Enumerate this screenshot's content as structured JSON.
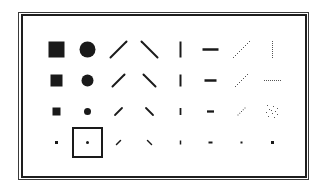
{
  "window": {
    "title": "Brush Shapes"
  },
  "colors": {
    "ink": "#1a1a1a",
    "dotted_ink": "#555555",
    "background": "#ffffff",
    "frame": "#1e1e1e"
  },
  "palette": {
    "columns": [
      "square",
      "circle",
      "forward-slash",
      "back-slash",
      "vertical-line",
      "horizontal-line",
      "dotted-forward-slash",
      "dotted-line"
    ],
    "rows": [
      {
        "size": "large"
      },
      {
        "size": "medium"
      },
      {
        "size": "small"
      },
      {
        "size": "tiny"
      }
    ],
    "selected": {
      "row": 3,
      "col": 1,
      "shape": "circle",
      "size": "tiny"
    },
    "brushes": [
      [
        {
          "shape": "square",
          "size": 16
        },
        {
          "shape": "circle",
          "size": 16
        },
        {
          "shape": "forward-slash",
          "size": 16
        },
        {
          "shape": "back-slash",
          "size": 16
        },
        {
          "shape": "vertical-line",
          "size": 16
        },
        {
          "shape": "horizontal-line",
          "size": 16
        },
        {
          "shape": "dotted-forward-slash",
          "size": 16
        },
        {
          "shape": "dotted-vertical-line",
          "size": 16
        }
      ],
      [
        {
          "shape": "square",
          "size": 12
        },
        {
          "shape": "circle",
          "size": 12
        },
        {
          "shape": "forward-slash",
          "size": 12
        },
        {
          "shape": "back-slash",
          "size": 12
        },
        {
          "shape": "vertical-line",
          "size": 12
        },
        {
          "shape": "horizontal-line",
          "size": 12
        },
        {
          "shape": "dotted-forward-slash",
          "size": 12
        },
        {
          "shape": "dotted-horizontal-line",
          "size": 16
        }
      ],
      [
        {
          "shape": "square",
          "size": 8
        },
        {
          "shape": "circle",
          "size": 7
        },
        {
          "shape": "forward-slash",
          "size": 7
        },
        {
          "shape": "back-slash",
          "size": 7
        },
        {
          "shape": "vertical-line",
          "size": 7
        },
        {
          "shape": "horizontal-line",
          "size": 7
        },
        {
          "shape": "dotted-forward-slash",
          "size": 7
        },
        {
          "shape": "spray",
          "size": 13
        }
      ],
      [
        {
          "shape": "square",
          "size": 3
        },
        {
          "shape": "circle",
          "size": 3
        },
        {
          "shape": "forward-slash",
          "size": 4
        },
        {
          "shape": "back-slash",
          "size": 4
        },
        {
          "shape": "vertical-line",
          "size": 4
        },
        {
          "shape": "horizontal-line",
          "size": 4
        },
        {
          "shape": "dot",
          "size": 2
        },
        {
          "shape": "dot",
          "size": 3
        }
      ]
    ]
  }
}
